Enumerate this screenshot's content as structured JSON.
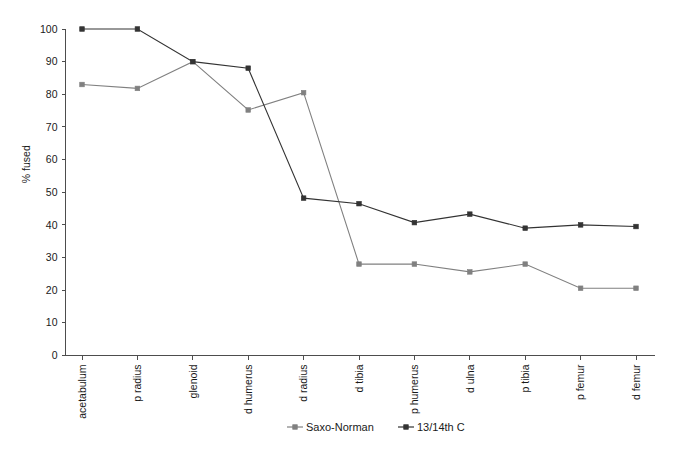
{
  "chart_data": {
    "type": "line",
    "title": "",
    "xlabel": "",
    "ylabel": "% fused",
    "ylim": [
      0,
      100
    ],
    "ytick_step": 10,
    "yticks": [
      0,
      10,
      20,
      30,
      40,
      50,
      60,
      70,
      80,
      90,
      100
    ],
    "grid": false,
    "legend_position": "bottom",
    "categories": [
      "acetabulum",
      "p radius",
      "glenoid",
      "d humerus",
      "d radius",
      "d tibia",
      "p humerus",
      "d ulna",
      "p tibia",
      "p femur",
      "d femur"
    ],
    "series": [
      {
        "name": "Saxo-Norman",
        "color": "#808080",
        "marker": "square",
        "values": [
          83,
          81.8,
          90,
          75.2,
          80.5,
          28,
          28,
          25.6,
          28,
          20.6,
          20.6
        ]
      },
      {
        "name": "13/14th C",
        "color": "#333333",
        "marker": "square",
        "values": [
          100,
          100,
          90,
          88,
          48.2,
          46.5,
          40.7,
          43.3,
          39,
          40,
          39.5
        ]
      }
    ]
  },
  "legend": {
    "items": [
      {
        "label": "Saxo-Norman",
        "color": "#808080"
      },
      {
        "label": "13/14th C",
        "color": "#333333"
      }
    ]
  },
  "axis": {
    "y_title": "% fused",
    "y_tick_labels": [
      "0",
      "10",
      "20",
      "30",
      "40",
      "50",
      "60",
      "70",
      "80",
      "90",
      "100"
    ]
  }
}
